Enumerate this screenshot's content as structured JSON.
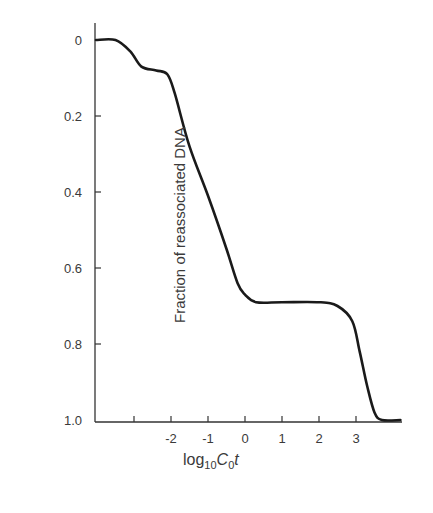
{
  "chart_data": {
    "type": "line",
    "title": "",
    "xlabel": "log10 C0t",
    "ylabel": "Fraction of reassociated DNA",
    "xlim": [
      -4.0,
      4.3
    ],
    "ylim": [
      0,
      1.0
    ],
    "y_inverted": true,
    "x_ticks": [
      -3,
      -2,
      -1,
      0,
      1,
      2,
      3
    ],
    "x_tick_labels": [
      "",
      "-2",
      "-1",
      "0",
      "1",
      "2",
      "3"
    ],
    "y_ticks": [
      0,
      0.2,
      0.4,
      0.6,
      0.8,
      1.0
    ],
    "y_tick_labels": [
      "0",
      "0.2",
      "0.4",
      "0.6",
      "0.8",
      "1.0"
    ],
    "grid": false,
    "legend": null,
    "series": [
      {
        "name": "reassociation curve",
        "x": [
          -4.0,
          -3.5,
          -3.1,
          -2.8,
          -2.4,
          -2.1,
          -1.9,
          -1.5,
          -1.0,
          -0.5,
          -0.2,
          0.0,
          0.3,
          1.0,
          2.0,
          2.5,
          2.9,
          3.1,
          3.3,
          3.5,
          3.7,
          4.2
        ],
        "y": [
          0.0,
          0.0,
          0.03,
          0.07,
          0.08,
          0.09,
          0.14,
          0.28,
          0.41,
          0.55,
          0.64,
          0.67,
          0.69,
          0.69,
          0.69,
          0.7,
          0.74,
          0.82,
          0.91,
          0.98,
          1.0,
          1.0
        ]
      }
    ]
  },
  "labels": {
    "y_axis_title": "Fraction of reassociated DNA",
    "x_axis_title_main": "log",
    "x_axis_title_sub": "10",
    "x_axis_title_var": "C",
    "x_axis_title_var_sub": "0",
    "x_axis_title_t": "t"
  }
}
